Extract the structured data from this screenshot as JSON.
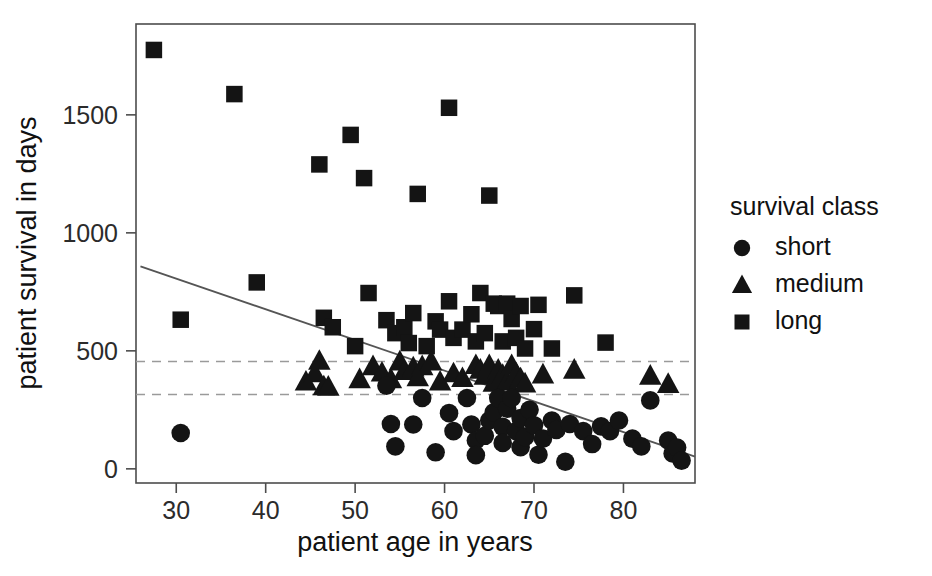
{
  "chart_data": {
    "type": "scatter",
    "title": "",
    "xlabel": "patient age in years",
    "ylabel": "patient survival in days",
    "xlim": [
      25.5,
      88.0
    ],
    "ylim": [
      -60,
      1885
    ],
    "xticks": [
      30,
      40,
      50,
      60,
      70,
      80
    ],
    "yticks": [
      0,
      500,
      1000,
      1500
    ],
    "xtick_labels": [
      "30",
      "40",
      "50",
      "60",
      "70",
      "80"
    ],
    "ytick_labels": [
      "0",
      "500",
      "1000",
      "1500"
    ],
    "grid": false,
    "legend": {
      "title": "survival class",
      "position": "right",
      "entries": [
        {
          "label": "short",
          "marker": "circle"
        },
        {
          "label": "medium",
          "marker": "triangle"
        },
        {
          "label": "long",
          "marker": "square"
        }
      ]
    },
    "reference_lines": [
      {
        "orientation": "horizontal",
        "y": 455,
        "style": "dashed"
      },
      {
        "orientation": "horizontal",
        "y": 315,
        "style": "dashed"
      }
    ],
    "trend_line": {
      "style": "solid",
      "x_start": 26.0,
      "y_start": 858,
      "x_end": 88.0,
      "y_end": 52
    },
    "series": [
      {
        "name": "short",
        "marker": "circle",
        "points": [
          [
            30.5,
            152
          ],
          [
            53.5,
            352
          ],
          [
            54.0,
            190
          ],
          [
            54.5,
            95
          ],
          [
            56.5,
            188
          ],
          [
            57.5,
            300
          ],
          [
            59.0,
            70
          ],
          [
            60.5,
            236
          ],
          [
            61.0,
            160
          ],
          [
            62.5,
            300
          ],
          [
            63.0,
            188
          ],
          [
            63.5,
            120
          ],
          [
            63.5,
            58
          ],
          [
            64.5,
            140
          ],
          [
            65.0,
            205
          ],
          [
            65.5,
            240
          ],
          [
            66.0,
            300
          ],
          [
            66.5,
            178
          ],
          [
            66.5,
            110
          ],
          [
            67.0,
            255
          ],
          [
            67.5,
            300
          ],
          [
            68.0,
            160
          ],
          [
            68.5,
            215
          ],
          [
            68.5,
            92
          ],
          [
            69.0,
            135
          ],
          [
            69.5,
            250
          ],
          [
            70.0,
            185
          ],
          [
            70.5,
            60
          ],
          [
            71.0,
            128
          ],
          [
            72.0,
            205
          ],
          [
            72.5,
            165
          ],
          [
            73.5,
            30
          ],
          [
            74.0,
            190
          ],
          [
            75.5,
            160
          ],
          [
            76.5,
            105
          ],
          [
            77.5,
            180
          ],
          [
            78.5,
            160
          ],
          [
            79.5,
            205
          ],
          [
            81.0,
            128
          ],
          [
            82.0,
            95
          ],
          [
            83.0,
            290
          ],
          [
            85.0,
            120
          ],
          [
            85.5,
            65
          ],
          [
            86.0,
            90
          ],
          [
            86.5,
            35
          ]
        ]
      },
      {
        "name": "medium",
        "marker": "triangle",
        "points": [
          [
            44.5,
            370
          ],
          [
            45.5,
            405
          ],
          [
            46.0,
            458
          ],
          [
            46.5,
            350
          ],
          [
            47.0,
            348
          ],
          [
            50.5,
            380
          ],
          [
            52.0,
            435
          ],
          [
            53.0,
            408
          ],
          [
            54.0,
            380
          ],
          [
            55.0,
            455
          ],
          [
            55.5,
            415
          ],
          [
            56.5,
            430
          ],
          [
            57.0,
            388
          ],
          [
            57.5,
            435
          ],
          [
            58.5,
            455
          ],
          [
            59.5,
            370
          ],
          [
            61.0,
            405
          ],
          [
            62.0,
            385
          ],
          [
            63.5,
            440
          ],
          [
            64.0,
            420
          ],
          [
            64.5,
            395
          ],
          [
            65.0,
            440
          ],
          [
            65.5,
            365
          ],
          [
            66.0,
            420
          ],
          [
            66.5,
            398
          ],
          [
            67.0,
            370
          ],
          [
            67.5,
            440
          ],
          [
            68.0,
            405
          ],
          [
            68.5,
            383
          ],
          [
            69.0,
            362
          ],
          [
            71.0,
            400
          ],
          [
            74.5,
            420
          ],
          [
            83.0,
            395
          ],
          [
            85.0,
            360
          ]
        ]
      },
      {
        "name": "long",
        "marker": "square",
        "points": [
          [
            27.5,
            1775
          ],
          [
            30.5,
            632
          ],
          [
            36.5,
            1588
          ],
          [
            39.0,
            790
          ],
          [
            46.0,
            1290
          ],
          [
            46.5,
            640
          ],
          [
            47.5,
            600
          ],
          [
            49.5,
            1415
          ],
          [
            50.0,
            520
          ],
          [
            51.0,
            1232
          ],
          [
            51.5,
            745
          ],
          [
            53.5,
            630
          ],
          [
            54.5,
            575
          ],
          [
            55.5,
            600
          ],
          [
            56.0,
            533
          ],
          [
            56.5,
            660
          ],
          [
            57.0,
            1165
          ],
          [
            58.0,
            520
          ],
          [
            59.0,
            625
          ],
          [
            59.5,
            590
          ],
          [
            60.5,
            1530
          ],
          [
            60.5,
            710
          ],
          [
            61.0,
            555
          ],
          [
            62.0,
            590
          ],
          [
            63.0,
            655
          ],
          [
            63.5,
            540
          ],
          [
            64.0,
            745
          ],
          [
            64.5,
            575
          ],
          [
            65.0,
            1158
          ],
          [
            65.5,
            700
          ],
          [
            66.0,
            690
          ],
          [
            66.5,
            540
          ],
          [
            67.0,
            700
          ],
          [
            67.5,
            635
          ],
          [
            68.0,
            555
          ],
          [
            68.5,
            690
          ],
          [
            69.0,
            510
          ],
          [
            70.0,
            592
          ],
          [
            70.5,
            695
          ],
          [
            72.0,
            510
          ],
          [
            74.5,
            735
          ],
          [
            78.0,
            535
          ]
        ]
      }
    ]
  }
}
